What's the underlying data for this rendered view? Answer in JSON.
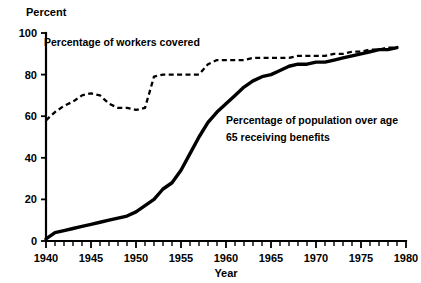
{
  "chart_data": {
    "type": "line",
    "title": "",
    "ylabel": "Percent",
    "xlabel": "Year",
    "xlim": [
      1940,
      1980
    ],
    "ylim": [
      0,
      100
    ],
    "grid": false,
    "legend_position": "inline-annotations",
    "x_ticks_major": [
      1940,
      1945,
      1950,
      1955,
      1960,
      1965,
      1970,
      1975,
      1980
    ],
    "x_tick_labels": [
      "1940",
      "1945",
      "1950",
      "1955",
      "1960",
      "1965",
      "1970",
      "1975",
      "1980"
    ],
    "x_minor_tick_step": 1,
    "y_ticks": [
      0,
      20,
      40,
      60,
      80,
      100
    ],
    "y_tick_labels": [
      "0",
      "20",
      "40",
      "60",
      "80",
      "100"
    ],
    "series": [
      {
        "name": "Percentage of workers covered",
        "style": "dashed",
        "x": [
          1940,
          1941,
          1942,
          1943,
          1944,
          1945,
          1946,
          1947,
          1948,
          1949,
          1950,
          1951,
          1952,
          1953,
          1954,
          1955,
          1956,
          1957,
          1958,
          1959,
          1960,
          1961,
          1962,
          1963,
          1964,
          1965,
          1966,
          1967,
          1968,
          1969,
          1970,
          1971,
          1972,
          1973,
          1974,
          1975,
          1976,
          1977,
          1978,
          1979
        ],
        "values": [
          58,
          62,
          65,
          67,
          70,
          71,
          70,
          66,
          64,
          64,
          63,
          64,
          79,
          80,
          80,
          80,
          80,
          80,
          85,
          87,
          87,
          87,
          87,
          88,
          88,
          88,
          88,
          88,
          89,
          89,
          89,
          89,
          90,
          90,
          91,
          91,
          92,
          92,
          93,
          93
        ]
      },
      {
        "name": "Percentage of population over age 65 receiving benefits",
        "style": "solid",
        "x": [
          1940,
          1941,
          1942,
          1943,
          1944,
          1945,
          1946,
          1947,
          1948,
          1949,
          1950,
          1951,
          1952,
          1953,
          1954,
          1955,
          1956,
          1957,
          1958,
          1959,
          1960,
          1961,
          1962,
          1963,
          1964,
          1965,
          1966,
          1967,
          1968,
          1969,
          1970,
          1971,
          1972,
          1973,
          1974,
          1975,
          1976,
          1977,
          1978,
          1979
        ],
        "values": [
          1,
          4,
          5,
          6,
          7,
          8,
          9,
          10,
          11,
          12,
          14,
          17,
          20,
          25,
          28,
          34,
          42,
          50,
          57,
          62,
          66,
          70,
          74,
          77,
          79,
          80,
          82,
          84,
          85,
          85,
          86,
          86,
          87,
          88,
          89,
          90,
          91,
          92,
          92,
          93
        ]
      }
    ],
    "annotations": [
      {
        "id": "workers-covered-label",
        "text": "Percentage of workers covered",
        "x_px": 44,
        "y_px": 46
      },
      {
        "id": "population-benefits-label-line1",
        "text": "Percentage of population over age",
        "x_px": 226,
        "y_px": 124
      },
      {
        "id": "population-benefits-label-line2",
        "text": "65 receiving benefits",
        "x_px": 226,
        "y_px": 141
      }
    ]
  },
  "labels": {
    "y_axis_title": "Percent",
    "x_axis_title": "Year"
  }
}
